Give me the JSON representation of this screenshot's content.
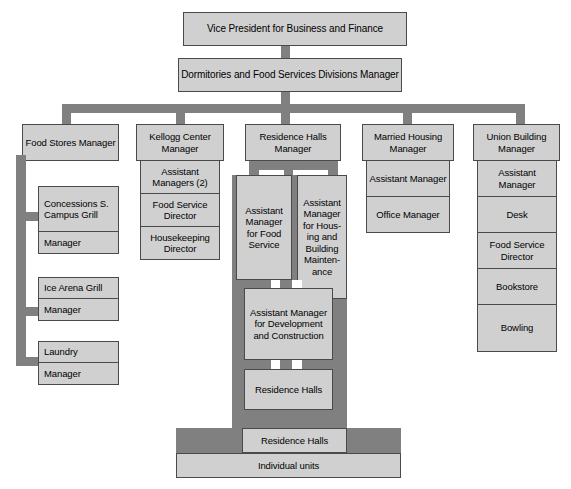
{
  "colors": {
    "box_fill": "#d0d0d0",
    "box_border": "#4a4a4a",
    "connector": "#808080",
    "background": "#ffffff",
    "text": "#000000"
  },
  "top": {
    "vice_president": "Vice President for Business and Finance",
    "division_manager": "Dormitories and Food Services Divisions Manager"
  },
  "columns": {
    "food_stores": {
      "header": "Food Stores Manager",
      "units": [
        {
          "name": "Concessions S. Campus Grill",
          "role": "Manager"
        },
        {
          "name": "Ice Arena Grill",
          "role": "Manager"
        },
        {
          "name": "Laundry",
          "role": "Manager"
        }
      ]
    },
    "kellogg_center": {
      "header": "Kellogg Center Manager",
      "items": [
        "Assistant Managers (2)",
        "Food Service Director",
        "Housekeeping Director"
      ]
    },
    "residence_halls": {
      "header": "Residence Halls Manager",
      "assistant_food_service": "Assistant Manager for Food Service",
      "assistant_housing": "Assistant Manager for Hous- ing and Building Mainten- ance",
      "assistant_development": "Assistant Manager for Development and Construction",
      "residence_halls_sub": "Residence Halls"
    },
    "married_housing": {
      "header": "Married Housing Manager",
      "items": [
        "Assistant Manager",
        "Office Manager"
      ]
    },
    "union_building": {
      "header": "Union Building Manager",
      "items": [
        "Assistant Manager",
        "Desk",
        "Food Service Director",
        "Bookstore",
        "Bowling"
      ]
    }
  },
  "bottom": {
    "residence_halls_bar": "Residence Halls",
    "individual_units_bar": "Individual units"
  }
}
